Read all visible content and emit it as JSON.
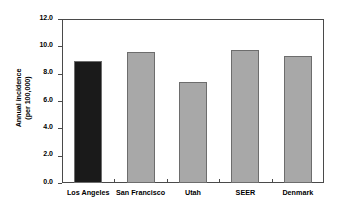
{
  "chart_data": {
    "type": "bar",
    "title": "",
    "xlabel": "",
    "ylabel": "Annual incidence\n(per 100,000)",
    "ylabel_line1": "Annual incidence",
    "ylabel_line2": "(per 100,000)",
    "categories": [
      "Los Angeles",
      "San Francisco",
      "Utah",
      "SEER",
      "Denmark"
    ],
    "values": [
      8.9,
      9.6,
      7.4,
      9.7,
      9.3
    ],
    "bar_colors": [
      "#1a1a1a",
      "#a8a8a8",
      "#a8a8a8",
      "#a8a8a8",
      "#a8a8a8"
    ],
    "bar_edge_color": "#6d6d6d",
    "ylim": [
      0.0,
      12.0
    ],
    "yticks": [
      0.0,
      2.0,
      4.0,
      6.0,
      8.0,
      10.0,
      12.0
    ],
    "ytick_labels": [
      "0.0",
      "2.0",
      "4.0",
      "6.0",
      "8.0",
      "10.0",
      "12.0"
    ],
    "grid": false,
    "legend": null,
    "frame_color": "#4a4a4a",
    "background": "#ffffff"
  }
}
